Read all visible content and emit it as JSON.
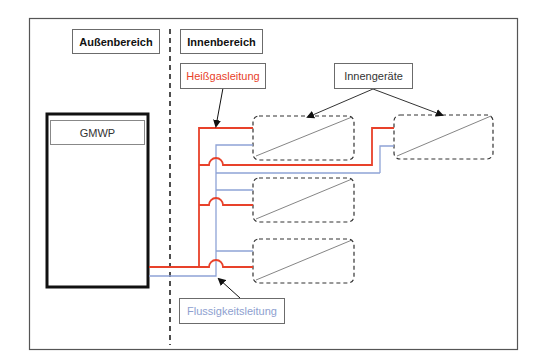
{
  "diagram": {
    "zones": {
      "outdoor": "Außenbereich",
      "indoor": "Innenbereich"
    },
    "outdoor_unit": "GMWP",
    "labels": {
      "hot_gas_line": "Heißgasleitung",
      "liquid_line": "Flussigkeitsleitung",
      "indoor_units": "Innengeräte"
    },
    "colors": {
      "hot_gas": "#e8412a",
      "liquid": "#8ea3d6",
      "frame": "#555555",
      "dashed": "#333333"
    },
    "indoor_unit_count": 4
  }
}
